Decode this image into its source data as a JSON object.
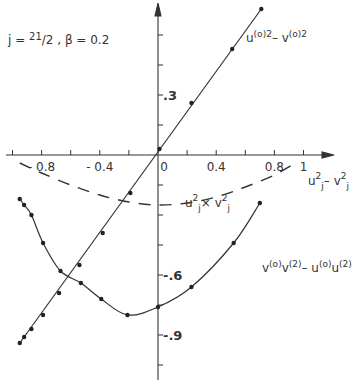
{
  "chart_data": {
    "type": "line",
    "title": "",
    "annotation": "j = 21/2 ,  β = 0.2",
    "parameters": {
      "j": "21/2",
      "beta": 0.2
    },
    "xlabel": "u_j^2 - v_j^2",
    "ylabel": "",
    "xlim": [
      -1.0,
      1.1
    ],
    "ylim": [
      -1.1,
      0.78
    ],
    "x_ticks": [
      -1.0,
      -0.8,
      -0.6,
      -0.4,
      -0.2,
      0,
      0.2,
      0.4,
      0.6,
      0.8,
      1.0
    ],
    "x_tick_labels": [
      {
        "value": -0.8,
        "text": "- 0.8"
      },
      {
        "value": -0.4,
        "text": "- 0.4"
      },
      {
        "value": 0,
        "text": "0"
      },
      {
        "value": 0.4,
        "text": "0.4"
      },
      {
        "value": 0.8,
        "text": "0.8"
      },
      {
        "value": 1.0,
        "text": "1"
      }
    ],
    "y_ticks": [
      0.6,
      0.45,
      0.3,
      0.15,
      0,
      -0.15,
      -0.3,
      -0.45,
      -0.6,
      -0.75,
      -0.9,
      -1.05
    ],
    "y_tick_labels": [
      {
        "value": 0.3,
        "text": ".3"
      },
      {
        "value": -0.6,
        "text": "-.6"
      },
      {
        "value": -0.9,
        "text": "-.9"
      }
    ],
    "grid": false,
    "series": [
      {
        "name": "u(0)^2 - v(0)^2",
        "label_text": "u(o)2 - v(o)2",
        "style": "solid",
        "markers": true,
        "points": [
          [
            -0.95,
            -0.94
          ],
          [
            -0.92,
            -0.91
          ],
          [
            -0.87,
            -0.87
          ],
          [
            -0.79,
            -0.8
          ],
          [
            -0.68,
            -0.69
          ],
          [
            -0.54,
            -0.55
          ],
          [
            -0.38,
            -0.39
          ],
          [
            -0.19,
            -0.19
          ],
          [
            0.01,
            0.03
          ],
          [
            0.23,
            0.26
          ],
          [
            0.51,
            0.53
          ],
          [
            0.71,
            0.73
          ]
        ]
      },
      {
        "name": "v(0)v(2) - u(0)u(2)",
        "label_text": "v(o)v(2) - u(o)u(2)",
        "style": "solid",
        "markers": true,
        "points": [
          [
            -0.95,
            -0.22
          ],
          [
            -0.92,
            -0.25
          ],
          [
            -0.87,
            -0.3
          ],
          [
            -0.79,
            -0.44
          ],
          [
            -0.67,
            -0.58
          ],
          [
            -0.53,
            -0.64
          ],
          [
            -0.39,
            -0.72
          ],
          [
            -0.21,
            -0.8
          ],
          [
            0.0,
            -0.76
          ],
          [
            0.23,
            -0.66
          ],
          [
            0.52,
            -0.44
          ],
          [
            0.7,
            -0.24
          ]
        ]
      },
      {
        "name": "u_j^2 x v_j^2",
        "label_text": "uj2 × vj2",
        "style": "dashed",
        "markers": false,
        "points": [
          [
            -0.95,
            -0.04
          ],
          [
            -0.8,
            -0.09
          ],
          [
            -0.6,
            -0.15
          ],
          [
            -0.4,
            -0.2
          ],
          [
            -0.2,
            -0.235
          ],
          [
            0.0,
            -0.25
          ],
          [
            0.2,
            -0.24
          ],
          [
            0.4,
            -0.21
          ],
          [
            0.6,
            -0.16
          ],
          [
            0.8,
            -0.1
          ],
          [
            0.92,
            -0.05
          ]
        ]
      }
    ]
  },
  "labels": {
    "annotation_j": "j = ",
    "annotation_j_val": "21/2",
    "annotation_beta": ",   β = 0.2",
    "x_axis_label": "u",
    "series1_label": "u",
    "series3_label": "u",
    "series2_label": "v"
  }
}
